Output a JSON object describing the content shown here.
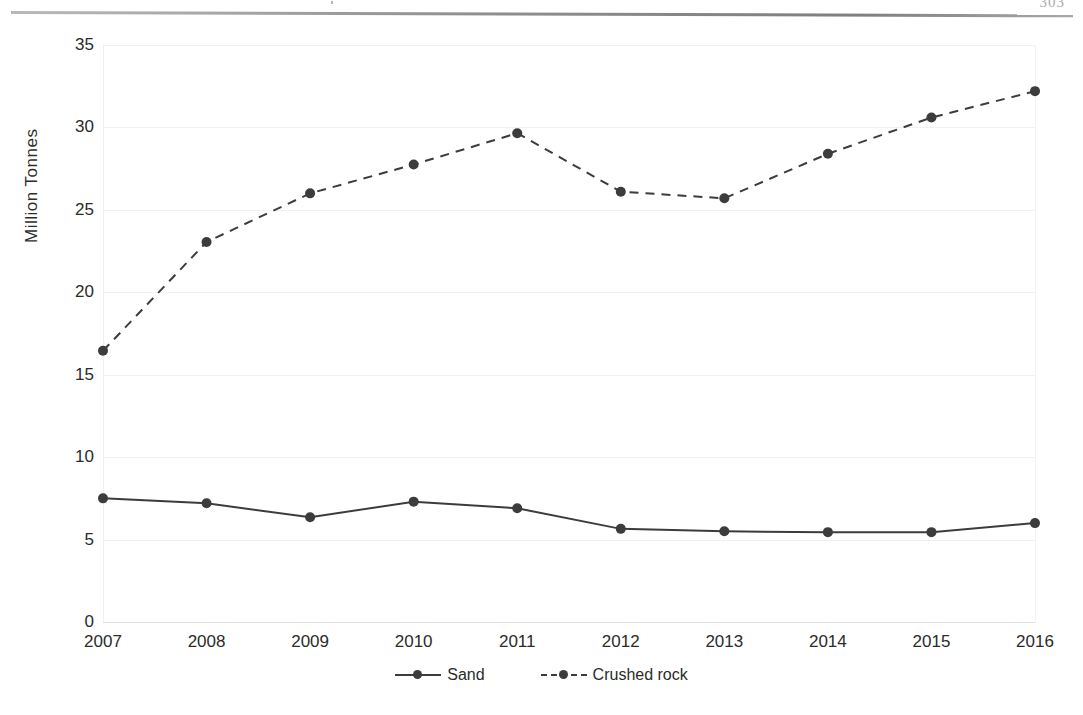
{
  "page": {
    "page_number": "303",
    "header_rule": true
  },
  "chart_data": {
    "type": "line",
    "title": "",
    "subtitle": "",
    "xlabel": "",
    "ylabel": "Million Tonnes",
    "categories": [
      "2007",
      "2008",
      "2009",
      "2010",
      "2011",
      "2012",
      "2013",
      "2014",
      "2015",
      "2016"
    ],
    "xlim": [
      2007,
      2016
    ],
    "ylim": [
      0,
      35
    ],
    "yticks": [
      0,
      5,
      10,
      15,
      20,
      25,
      30,
      35
    ],
    "ytick_labels": [
      "0",
      "5",
      "10",
      "15",
      "20",
      "25",
      "30",
      "35"
    ],
    "grid": true,
    "legend_position": "bottom",
    "series": [
      {
        "name": "Sand",
        "style": "solid",
        "marker": "circle",
        "color": "#3c3c3c",
        "values": [
          7.5,
          7.2,
          6.35,
          7.3,
          6.9,
          5.65,
          5.5,
          5.45,
          5.45,
          6.0
        ]
      },
      {
        "name": "Crushed rock",
        "style": "dashed",
        "marker": "circle",
        "color": "#3c3c3c",
        "values": [
          16.45,
          23.05,
          26.0,
          27.75,
          29.65,
          26.1,
          25.7,
          28.4,
          30.6,
          32.2
        ]
      }
    ]
  }
}
